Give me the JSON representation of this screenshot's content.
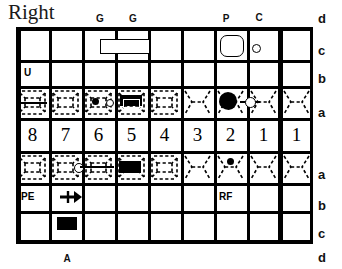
{
  "title": "Right",
  "chart_type": "dental-odontogram",
  "grid": {
    "columns": 9,
    "rows": [
      "c",
      "b",
      "a_upper",
      "numbers",
      "a_lower",
      "b",
      "c"
    ],
    "midline_after_column_index": 7
  },
  "tooth_numbers": [
    "8",
    "7",
    "6",
    "5",
    "4",
    "3",
    "2",
    "1",
    "1"
  ],
  "top_markers": [
    {
      "label": "G",
      "column": 6
    },
    {
      "label": "G",
      "column": 5
    },
    {
      "label": "P",
      "column": 2
    },
    {
      "label": "C",
      "column": 1
    }
  ],
  "row_labels_right": {
    "top_outer": "d",
    "top_c": "c",
    "top_b": "b",
    "upper_a": "a",
    "lower_a": "a",
    "lower_b": "b",
    "lower_c": "c",
    "bottom_outer": "d"
  },
  "bottom_markers": [
    {
      "label": "A",
      "column": 7
    }
  ],
  "cell_codes": [
    {
      "row": "upper_b",
      "column": 8,
      "text": "U"
    },
    {
      "row": "lower_b",
      "column": 8,
      "text": "PE"
    },
    {
      "row": "lower_b",
      "column": 2,
      "text": "RF"
    }
  ],
  "annotations": {
    "upper_c_bridge_rect": {
      "columns": "6-5",
      "shape": "open-rectangle"
    },
    "upper_c_crown": {
      "column": 2,
      "shape": "rounded-square-outline"
    },
    "upper_c_small_circle": {
      "column": 1,
      "shape": "open-circle"
    },
    "upper_a_col8_line": {
      "column": 8,
      "shape": "horizontal-line"
    },
    "upper_a_col6_dot": {
      "column": 6,
      "shape": "filled-dot"
    },
    "upper_a_col6_circle": {
      "column": 6,
      "shape": "open-circle"
    },
    "upper_a_col5_filling": {
      "column": 5,
      "shape": "filled-rectangle"
    },
    "upper_a_col2_blob": {
      "column": 2,
      "shape": "large-filled-blob"
    },
    "upper_a_col1_circle": {
      "column": 1,
      "shape": "open-circle-with-line"
    },
    "lower_a_col7_circle_line": {
      "column": "7-6",
      "shape": "open-circle-with-line"
    },
    "lower_a_col5_filling": {
      "column": 5,
      "shape": "filled-rectangle"
    },
    "lower_a_col2_dot": {
      "column": 2,
      "shape": "filled-dot"
    },
    "lower_b_col7_arrow": {
      "column": 7,
      "shape": "right-arrow"
    },
    "lower_c_col7_block": {
      "column": 7,
      "shape": "filled-rectangle"
    }
  },
  "colors": {
    "ink": "#000000",
    "paper": "#ffffff",
    "title_ink": "#1a1a1a"
  }
}
